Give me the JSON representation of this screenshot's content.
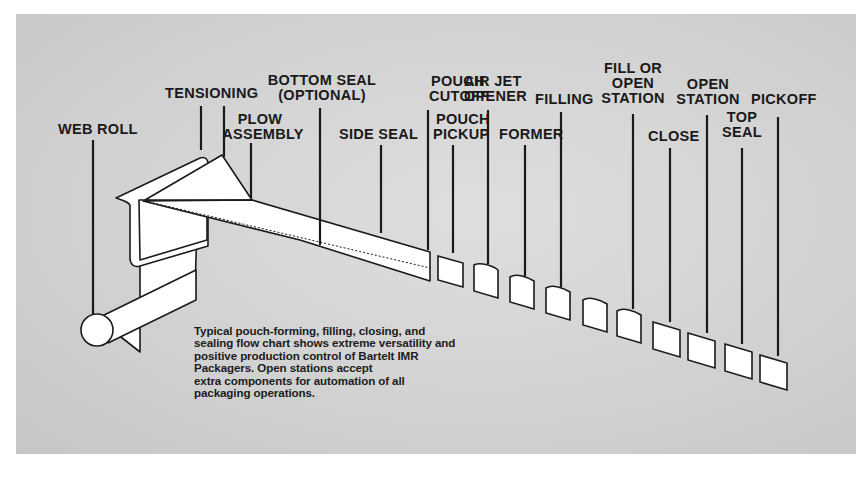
{
  "diagram": {
    "title": "Pouch-forming, filling, closing, and sealing flow chart",
    "labels": [
      {
        "id": "web-roll",
        "lines": [
          "WEB ROLL"
        ]
      },
      {
        "id": "tensioning",
        "lines": [
          "TENSIONING"
        ]
      },
      {
        "id": "plow-assembly",
        "lines": [
          "PLOW",
          "ASSEMBLY"
        ]
      },
      {
        "id": "bottom-seal",
        "lines": [
          "BOTTOM SEAL",
          "(OPTIONAL)"
        ]
      },
      {
        "id": "side-seal",
        "lines": [
          "SIDE SEAL"
        ]
      },
      {
        "id": "pouch-cutoff",
        "lines": [
          "POUCH",
          "CUTOFF"
        ]
      },
      {
        "id": "pouch-pickup",
        "lines": [
          "POUCH",
          "PICKUP"
        ]
      },
      {
        "id": "air-jet-opener",
        "lines": [
          "AIR JET",
          "OPENER"
        ]
      },
      {
        "id": "former",
        "lines": [
          "FORMER"
        ]
      },
      {
        "id": "filling",
        "lines": [
          "FILLING"
        ]
      },
      {
        "id": "fill-or-open-station",
        "lines": [
          "FILL OR",
          "OPEN",
          "STATION"
        ]
      },
      {
        "id": "close",
        "lines": [
          "CLOSE"
        ]
      },
      {
        "id": "open-station",
        "lines": [
          "OPEN",
          "STATION"
        ]
      },
      {
        "id": "top-seal",
        "lines": [
          "TOP",
          "SEAL"
        ]
      },
      {
        "id": "pickoff",
        "lines": [
          "PICKOFF"
        ]
      }
    ],
    "caption": [
      "Typical pouch-forming, filling, closing, and",
      "sealing flow chart shows extreme versatility and",
      "positive production control of Bartelt IMR",
      "Packagers. Open stations accept",
      "extra components for automation of all",
      "packaging operations."
    ],
    "colors": {
      "background": "#d4d4d4",
      "ink": "#1a1a1a",
      "paper": "#ffffff"
    }
  }
}
